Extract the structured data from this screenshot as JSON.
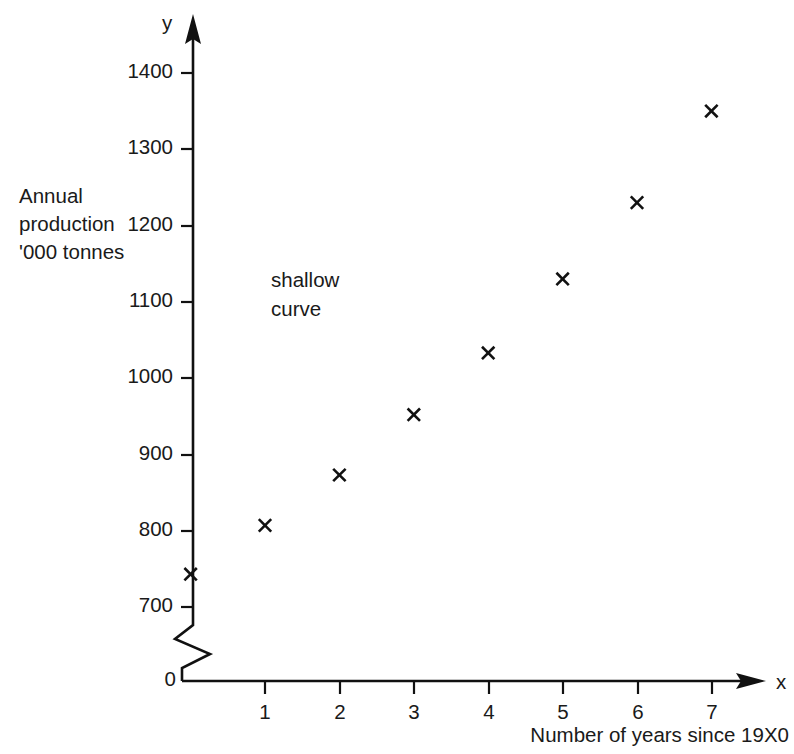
{
  "chart_data": {
    "type": "scatter",
    "title": "",
    "xlabel": "Number of years since 19X0",
    "ylabel": "Annual production '000 tonnes",
    "x": [
      0,
      1,
      2,
      3,
      4,
      5,
      6,
      7
    ],
    "values": [
      743,
      807,
      873,
      952,
      1033,
      1130,
      1230,
      1350
    ],
    "series": [
      {
        "name": "Annual production",
        "marker": "x",
        "values": [
          743,
          807,
          873,
          952,
          1033,
          1130,
          1230,
          1350
        ]
      }
    ],
    "xlim": [
      0,
      7.6
    ],
    "ylim": [
      700,
      1430
    ],
    "y_axis_broken": true,
    "y_break_between": [
      0,
      700
    ],
    "grid": false,
    "legend": null,
    "annotations": [
      {
        "text": "shallow\ncurve",
        "x": 1.05,
        "y": 1155
      }
    ],
    "xticks": [
      1,
      2,
      3,
      4,
      5,
      6,
      7
    ],
    "xtick_labels": [
      "1",
      "2",
      "3",
      "4",
      "5",
      "6",
      "7"
    ],
    "yticks": [
      700,
      800,
      900,
      1000,
      1100,
      1200,
      1300,
      1400
    ],
    "ytick_labels": [
      "700",
      "800",
      "900",
      "1000",
      "1100",
      "1200",
      "1300",
      "1400"
    ],
    "origin_label": "0",
    "x_axis_symbol": "x",
    "y_axis_symbol": "y"
  },
  "axes": {
    "y_symbol": "y",
    "x_symbol": "x",
    "origin": "0",
    "y_title": "Annual\nproduction\n'000 tonnes",
    "x_title": "Number of years since 19X0"
  },
  "annotation": {
    "text": "shallow\ncurve"
  },
  "ticks": {
    "y": [
      "1400",
      "1300",
      "1200",
      "1100",
      "1000",
      "900",
      "800",
      "700"
    ],
    "x": [
      "1",
      "2",
      "3",
      "4",
      "5",
      "6",
      "7"
    ]
  },
  "colors": {
    "ink": "#111111",
    "background": "#ffffff"
  }
}
